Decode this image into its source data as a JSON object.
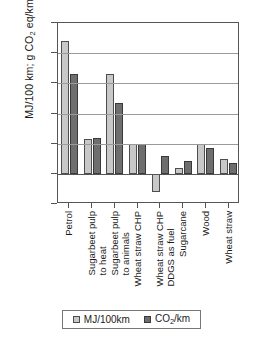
{
  "chart_data": {
    "type": "bar",
    "title": "",
    "xlabel": "",
    "ylabel": "MJ/100 km; g CO2 eq/km",
    "ylabel_parts": {
      "pre": "MJ/100 km; g CO",
      "sub": "2",
      "post": " eq/km"
    },
    "ylim": [
      -50,
      250
    ],
    "yticks": [
      -50,
      0,
      50,
      100,
      150,
      200,
      250
    ],
    "ytick_labels": [
      "-50",
      "0",
      "50",
      "100",
      "150",
      "200",
      "250"
    ],
    "grid": true,
    "legend_position": "bottom",
    "categories": [
      "Petrol",
      "Sugarbeet pulp to heat",
      "Sugarbeet pulp to animals",
      "Wheat straw CHP",
      "Wheat straw CHP DDGS as fuel",
      "Sugarcane",
      "Wood",
      "Wheat straw"
    ],
    "category_lines": [
      [
        "Petrol",
        ""
      ],
      [
        "Sugarbeet pulp",
        "to heat"
      ],
      [
        "Sugarbeet pulp",
        "to animals"
      ],
      [
        "Wheat straw CHP",
        ""
      ],
      [
        "Wheat straw CHP",
        "DDGS as fuel"
      ],
      [
        "Sugarcane",
        ""
      ],
      [
        "Wood",
        ""
      ],
      [
        "Wheat straw",
        ""
      ]
    ],
    "series": [
      {
        "name": "MJ/100km",
        "color": "#c8c8c8",
        "values": [
          220,
          57,
          165,
          50,
          -30,
          10,
          50,
          25
        ]
      },
      {
        "name": "CO2/km",
        "color": "#6e6e6e",
        "values": [
          165,
          60,
          117,
          50,
          30,
          22,
          43,
          18
        ]
      }
    ]
  },
  "legend": {
    "items": [
      {
        "label": "MJ/100km",
        "pre": "MJ/100km",
        "sub": "",
        "post": ""
      },
      {
        "label": "CO2/km",
        "pre": "CO",
        "sub": "2",
        "post": "/km"
      }
    ]
  }
}
